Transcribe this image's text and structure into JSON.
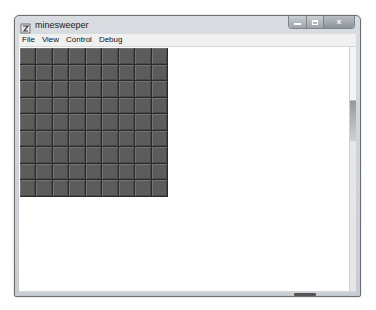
{
  "window": {
    "title": "minesweeper",
    "app_icon": "minesweeper-app-icon",
    "caption_buttons": {
      "minimize": "minimize",
      "maximize": "maximize",
      "close": "x"
    }
  },
  "menubar": {
    "items": [
      {
        "label": "File"
      },
      {
        "label": "View"
      },
      {
        "label": "Control"
      },
      {
        "label": "Debug"
      }
    ]
  },
  "board": {
    "rows": 9,
    "columns": 9,
    "cell_state": "covered",
    "colors": {
      "cell": "#5c5c5c",
      "grid_line": "#2a2a2a"
    }
  },
  "colors": {
    "frame": "#c7ccd2",
    "menubar": "#f0f0f0",
    "client": "#ffffff"
  }
}
